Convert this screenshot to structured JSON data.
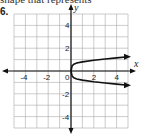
{
  "header_text": "shape that represents",
  "problem_number": "6.",
  "chart_data": {
    "type": "line",
    "title": "",
    "xlabel": "x",
    "ylabel": "y",
    "xlim": [
      -5,
      5
    ],
    "ylim": [
      -5,
      5
    ],
    "grid": true,
    "x_ticks": [
      "-4",
      "-2",
      "0",
      "2",
      "4"
    ],
    "y_ticks": [
      "4",
      "2",
      "-2",
      "-4"
    ],
    "series": [
      {
        "name": "upper branch",
        "x": [
          0,
          0.1,
          0.25,
          0.5,
          1,
          2,
          3,
          4,
          5
        ],
        "y": [
          0,
          0.45,
          0.6,
          0.7,
          0.8,
          0.95,
          1.05,
          1.15,
          1.25
        ],
        "arrow_end": true
      },
      {
        "name": "lower branch",
        "x": [
          0,
          0.1,
          0.25,
          0.5,
          1,
          2,
          3,
          4,
          5
        ],
        "y": [
          0,
          -0.45,
          -0.6,
          -0.7,
          -0.8,
          -0.95,
          -1.05,
          -1.15,
          -1.25
        ],
        "arrow_end": true
      }
    ]
  }
}
